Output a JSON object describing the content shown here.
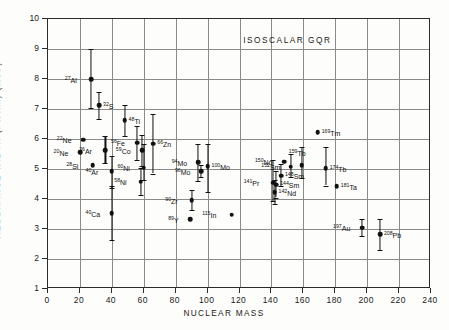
{
  "figure": {
    "title": "ISOSCALAR GQR",
    "title_x": 150,
    "title_y": 9.3,
    "xtitle": "NUCLEAR MASS",
    "ytitle": "RESONANCE WIDTH (FWHM)  (MeV)"
  },
  "chart_data": {
    "type": "scatter",
    "title": "ISOSCALAR GQR",
    "xlabel": "NUCLEAR MASS",
    "ylabel": "RESONANCE WIDTH (FWHM)  (MeV)",
    "xlim": [
      0,
      240
    ],
    "ylim": [
      1,
      10
    ],
    "xticks": [
      0,
      20,
      40,
      60,
      80,
      100,
      120,
      140,
      160,
      180,
      200,
      220,
      240
    ],
    "yticks": [
      1,
      2,
      3,
      4,
      5,
      6,
      7,
      8,
      9,
      10
    ],
    "grid": true,
    "legend": "none",
    "marker": "filled-circle",
    "points": [
      {
        "label": "Al",
        "mass_sup": "27",
        "x": 27,
        "y": 8.0,
        "err_lo": 7.05,
        "err_hi": 9.0,
        "lab_pos": "left"
      },
      {
        "label": "S",
        "mass_sup": "32",
        "x": 32,
        "y": 7.12,
        "err_lo": 6.67,
        "err_hi": 7.58,
        "lab_pos": "right"
      },
      {
        "label": "Ti",
        "mass_sup": "48",
        "x": 48,
        "y": 6.62,
        "err_lo": 6.1,
        "err_hi": 7.15,
        "lab_pos": "right"
      },
      {
        "label": "Ne",
        "mass_sup": "22",
        "x": 22,
        "y": 5.98,
        "err_lo": null,
        "err_hi": null,
        "lab_pos": "left"
      },
      {
        "label": "Ne",
        "mass_sup": "20",
        "x": 20,
        "y": 5.56,
        "err_lo": null,
        "err_hi": null,
        "lab_pos": "left"
      },
      {
        "label": "Ar",
        "mass_sup": "36",
        "x": 36,
        "y": 5.62,
        "err_lo": 5.2,
        "err_hi": 6.1,
        "lab_pos": "left"
      },
      {
        "label": "Fe",
        "mass_sup": "56",
        "x": 56,
        "y": 5.88,
        "err_lo": 5.3,
        "err_hi": 6.45,
        "lab_pos": "left"
      },
      {
        "label": "Co",
        "mass_sup": "59",
        "x": 59,
        "y": 5.62,
        "err_lo": 5.1,
        "err_hi": 6.12,
        "lab_pos": "left"
      },
      {
        "label": "Zn",
        "mass_sup": "66",
        "x": 66,
        "y": 5.84,
        "err_lo": 4.85,
        "err_hi": 6.82,
        "lab_pos": "right"
      },
      {
        "label": "Si",
        "mass_sup": "28",
        "x": 28,
        "y": 5.12,
        "err_lo": null,
        "err_hi": null,
        "lab_pos": "left"
      },
      {
        "label": "Ni",
        "mass_sup": "60",
        "x": 60,
        "y": 5.05,
        "err_lo": 4.62,
        "err_hi": 5.85,
        "lab_pos": "left"
      },
      {
        "label": "Ar",
        "mass_sup": "40",
        "x": 40,
        "y": 4.92,
        "err_lo": 4.38,
        "err_hi": 5.45,
        "lab_pos": "left"
      },
      {
        "label": "Ni",
        "mass_sup": "58",
        "x": 58,
        "y": 4.58,
        "err_lo": 4.12,
        "err_hi": 5.05,
        "lab_pos": "left"
      },
      {
        "label": "Mo",
        "mass_sup": "94",
        "x": 94,
        "y": 5.22,
        "err_lo": 4.6,
        "err_hi": 5.82,
        "lab_pos": "left"
      },
      {
        "label": "Mo",
        "mass_sup": "96",
        "x": 96,
        "y": 4.92,
        "err_lo": 4.72,
        "err_hi": 5.12,
        "lab_pos": "left"
      },
      {
        "label": "Mo",
        "mass_sup": "100",
        "x": 100,
        "y": 5.1,
        "err_lo": 4.22,
        "err_hi": 5.85,
        "lab_pos": "right"
      },
      {
        "label": "Ca",
        "mass_sup": "40",
        "x": 40,
        "y": 3.52,
        "err_lo": 2.62,
        "err_hi": 4.42,
        "lab_pos": "left"
      },
      {
        "label": "Zr",
        "mass_sup": "90",
        "x": 90,
        "y": 3.96,
        "err_lo": 3.62,
        "err_hi": 4.3,
        "lab_pos": "left"
      },
      {
        "label": "Y",
        "mass_sup": "89",
        "x": 89,
        "y": 3.32,
        "err_lo": null,
        "err_hi": null,
        "lab_pos": "left"
      },
      {
        "label": "In",
        "mass_sup": "115",
        "x": 115,
        "y": 3.48,
        "err_lo": null,
        "err_hi": null,
        "lab_pos": "left"
      },
      {
        "label": "Tm",
        "mass_sup": "169",
        "x": 169,
        "y": 6.22,
        "err_lo": null,
        "err_hi": null,
        "lab_pos": "right"
      },
      {
        "label": "Nd",
        "mass_sup": "150",
        "x": 148,
        "y": 5.25,
        "err_lo": null,
        "err_hi": null,
        "lab_pos": "left"
      },
      {
        "label": "Tb",
        "mass_sup": "159",
        "x": 159,
        "y": 5.12,
        "err_lo": 4.7,
        "err_hi": 5.75,
        "lab_pos": "top"
      },
      {
        "label": "Sm",
        "mass_sup": "152",
        "x": 152,
        "y": 5.08,
        "err_lo": 4.72,
        "err_hi": 5.5,
        "lab_pos": "left"
      },
      {
        "label": "Sm",
        "mass_sup": "148",
        "x": 146,
        "y": 4.78,
        "err_lo": 4.42,
        "err_hi": 5.18,
        "lab_pos": "right"
      },
      {
        "label": "Tb",
        "mass_sup": "174",
        "x": 174,
        "y": 5.02,
        "err_lo": 4.45,
        "err_hi": 5.72,
        "lab_pos": "right"
      },
      {
        "label": "Pr",
        "mass_sup": "141",
        "x": 141,
        "y": 4.55,
        "err_lo": 3.95,
        "err_hi": 5.3,
        "lab_pos": "left"
      },
      {
        "label": "Sm",
        "mass_sup": "144",
        "x": 143,
        "y": 4.48,
        "err_lo": 4.05,
        "err_hi": 4.92,
        "lab_pos": "right"
      },
      {
        "label": "Nd",
        "mass_sup": "142",
        "x": 142,
        "y": 4.22,
        "err_lo": 3.82,
        "err_hi": 4.62,
        "lab_pos": "right"
      },
      {
        "label": "Ta",
        "mass_sup": "181",
        "x": 181,
        "y": 4.42,
        "err_lo": null,
        "err_hi": null,
        "lab_pos": "right"
      },
      {
        "label": "Au",
        "mass_sup": "197",
        "x": 197,
        "y": 3.05,
        "err_lo": 2.78,
        "err_hi": 3.35,
        "lab_pos": "left"
      },
      {
        "label": "Pb",
        "mass_sup": "208",
        "x": 208,
        "y": 2.82,
        "err_lo": 2.3,
        "err_hi": 3.35,
        "lab_pos": "right"
      }
    ]
  },
  "colors": {
    "marker": "#111111",
    "axis": "#2b2b2b",
    "grid": "#8a8a8a",
    "background": "#fdfdfb"
  }
}
